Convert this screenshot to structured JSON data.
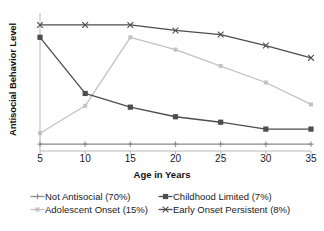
{
  "chart_data": {
    "type": "line",
    "title": "",
    "xlabel": "Age in Years",
    "ylabel": "Antisocial Behavior Level",
    "x": [
      5,
      10,
      15,
      20,
      25,
      30,
      35
    ],
    "xticklabels": [
      "5",
      "10",
      "15",
      "20",
      "25",
      "30",
      "35"
    ],
    "xlim": [
      5,
      35
    ],
    "ylim": [
      0,
      1
    ],
    "yticklabels": [],
    "grid": false,
    "legend_position": "below-axis",
    "axis_style": "left-and-bottom-spines-only",
    "series": [
      {
        "name": "Not Antisocial (70%)",
        "label": "Not Antisocial (70%)",
        "share": "70%",
        "marker": "plus",
        "color": "#8a8a8a",
        "values": [
          0.05,
          0.05,
          0.05,
          0.05,
          0.05,
          0.05,
          0.05
        ]
      },
      {
        "name": "Childhood Limited (7%)",
        "label": "Childhood Limited (7%)",
        "share": "7%",
        "marker": "square",
        "color": "#4d4d4d",
        "values": [
          0.83,
          0.42,
          0.32,
          0.25,
          0.21,
          0.16,
          0.16
        ]
      },
      {
        "name": "Adolescent Onset (15%)",
        "label": "Adolescent Onset (15%)",
        "share": "15%",
        "marker": "small-square",
        "color": "#c2c2c2",
        "values": [
          0.13,
          0.33,
          0.83,
          0.74,
          0.62,
          0.5,
          0.34
        ]
      },
      {
        "name": "Early Onset Persistent (8%)",
        "label": "Early Onset Persistent (8%)",
        "share": "8%",
        "marker": "cross",
        "color": "#4d4d4d",
        "values": [
          0.92,
          0.92,
          0.92,
          0.88,
          0.85,
          0.77,
          0.68
        ]
      }
    ]
  },
  "legend": {
    "items": [
      "Not Antisocial (70%)",
      "Childhood Limited (7%)",
      "Adolescent Onset (15%)",
      "Early Onset Persistent (8%)"
    ]
  },
  "axes": {
    "x_title": "Age in Years",
    "y_title": "Antisocial Behavior Level",
    "spine_color": "#b8b8b8"
  }
}
